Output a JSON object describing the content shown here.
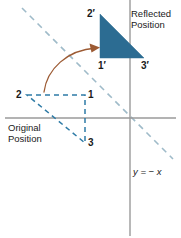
{
  "figure": {
    "type": "geometry-reflection-diagram",
    "background": "#ffffff"
  },
  "colors": {
    "triangle_fill": "#2C6C92",
    "dashed_shape": "#2E7BA6",
    "mirror_line": "#9FBBC9",
    "axis": "#9a9a9a",
    "arrow": "#9C5A33",
    "text": "#1a1a1a"
  },
  "labels": {
    "two_prime": "2′",
    "one_prime": "1′",
    "three_prime": "3′",
    "two": "2",
    "one": "1",
    "three": "3",
    "reflected_position": "Reflected\nPosition",
    "reflected_position_line1": "Reflected",
    "reflected_position_line2": "Position",
    "original_position_line1": "Original",
    "original_position_line2": "Position",
    "equation": "y = − x"
  },
  "geometry": {
    "axes": {
      "x_axis": {
        "x1": 5,
        "y1": 118,
        "x2": 176,
        "y2": 118
      },
      "y_axis": {
        "x1": 130,
        "y1": 0,
        "x2": 130,
        "y2": 236
      },
      "origin": {
        "x": 130,
        "y": 118
      }
    },
    "mirror_line": {
      "x1": 22,
      "y1": 8,
      "x2": 173,
      "y2": 159,
      "dash": "6 5"
    },
    "reflected_triangle": {
      "points": "100,14 100,58 144,58",
      "vertices": [
        {
          "name": "2′",
          "x": 100,
          "y": 14
        },
        {
          "name": "1′",
          "x": 100,
          "y": 58
        },
        {
          "name": "3′",
          "x": 144,
          "y": 58
        }
      ]
    },
    "original_triangle": {
      "points": "27,95 85,95 85,143",
      "vertices": [
        {
          "name": "2",
          "x": 27,
          "y": 95
        },
        {
          "name": "1",
          "x": 85,
          "y": 95
        },
        {
          "name": "3",
          "x": 85,
          "y": 143
        }
      ],
      "dash": "5 4"
    },
    "arrow": {
      "path": "M 44,92 C 48,68 68,49 97,48",
      "head": "97,48 88,44 90,53"
    }
  }
}
